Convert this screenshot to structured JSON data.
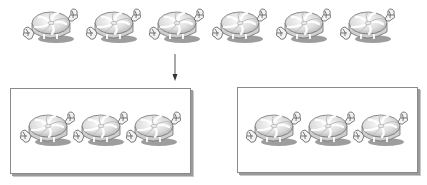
{
  "diagram": {
    "top_row": {
      "count": 6,
      "items": [
        {
          "icon": "wrapped-candy-icon",
          "x": 22,
          "y": 8
        },
        {
          "icon": "wrapped-candy-icon",
          "x": 85,
          "y": 8
        },
        {
          "icon": "wrapped-candy-icon",
          "x": 148,
          "y": 8
        },
        {
          "icon": "wrapped-candy-icon",
          "x": 211,
          "y": 8
        },
        {
          "icon": "wrapped-candy-icon",
          "x": 275,
          "y": 8
        },
        {
          "icon": "wrapped-candy-icon",
          "x": 339,
          "y": 8
        }
      ]
    },
    "arrow": {
      "icon": "down-arrow-icon",
      "direction": "down"
    },
    "groups": [
      {
        "name": "group-1",
        "count": 3
      },
      {
        "name": "group-2",
        "count": 3
      }
    ],
    "colors": {
      "candy_fill": "#e6e6e6",
      "candy_stripe": "#ffffff",
      "candy_outline": "#555555",
      "shadow": "#9a9a9a",
      "box_border": "#8a8a8a"
    }
  }
}
